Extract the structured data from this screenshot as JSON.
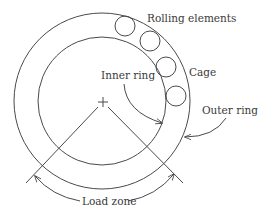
{
  "diagram": {
    "labels": {
      "rolling_elements": "Rolling elements",
      "cage": "Cage",
      "inner_ring": "Inner ring",
      "outer_ring": "Outer ring",
      "load_zone": "Load zone"
    },
    "components": [
      "outer-ring",
      "inner-ring",
      "rolling-element",
      "rolling-element",
      "rolling-element",
      "rolling-element",
      "center-mark",
      "load-zone-lines",
      "load-zone-arc"
    ],
    "colors": {
      "stroke": "#4a4a4a",
      "text": "#3a3a3a",
      "background": "#ffffff"
    }
  }
}
